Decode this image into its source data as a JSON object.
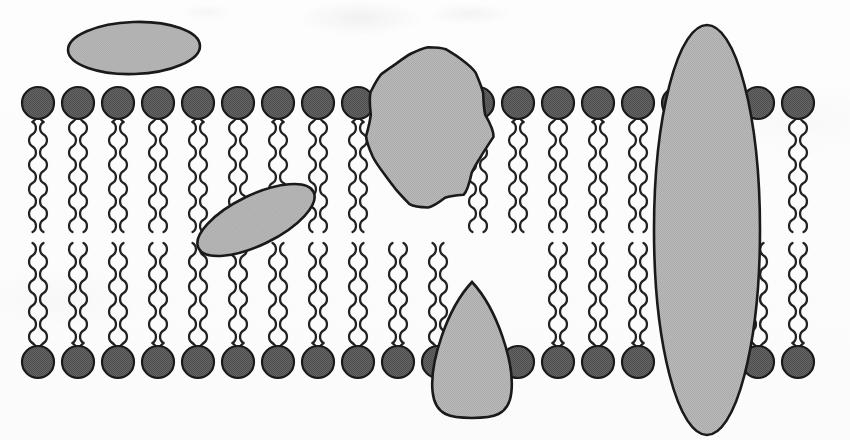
{
  "figure": {
    "name": "phospholipid-bilayer-membrane-diagram",
    "type": "biological-schematic",
    "width": 850,
    "height": 440,
    "background_color": "#fcfcfc",
    "title": "",
    "caption": "",
    "labels": []
  },
  "palette": {
    "paper": "#fcfcfc",
    "outline": "#1a1a1a",
    "lipid_head_fill": "#5e5e5e",
    "lipid_head_fill_dark": "#4f4f4f",
    "lipid_tail_stroke": "#222222",
    "protein_fill": "#b5b5b5",
    "protein_fill_light": "#bdbdbd",
    "protein_outline": "#1a1a1a"
  },
  "membrane": {
    "name": "phospholipid-bilayer",
    "leaflets": 2,
    "upper_leaflet": {
      "name": "upper-leaflet",
      "head_center_y": 103,
      "head_radius_x": 16,
      "head_radius_y": 16,
      "tail_top_y": 118,
      "tail_bottom_y": 232,
      "tails_per_lipid": 2,
      "tail_wave_cycles": 9,
      "lipid_count": 20
    },
    "lower_leaflet": {
      "name": "lower-leaflet",
      "head_center_y": 362,
      "head_radius_x": 16,
      "head_radius_y": 16,
      "tail_top_y": 243,
      "tail_bottom_y": 347,
      "tails_per_lipid": 2,
      "tail_wave_cycles": 8,
      "lipid_count": 20
    },
    "lipid_x_start": 38,
    "lipid_x_spacing": 40.2,
    "hydrophobic_core_gap_y": [
      232,
      243
    ],
    "upper_head_centers_x": [
      38,
      78,
      118,
      158,
      198,
      238,
      278,
      318,
      358,
      398,
      438,
      478,
      518,
      558,
      598,
      638,
      678,
      718,
      758,
      798
    ],
    "lower_head_centers_x": [
      38,
      78,
      118,
      158,
      198,
      238,
      278,
      318,
      358,
      398,
      438,
      478,
      518,
      558,
      598,
      638,
      678,
      718,
      758,
      798
    ],
    "upper_heads_hidden_indices": [
      9,
      10,
      17
    ],
    "lower_heads_hidden_indices": [
      11,
      16
    ],
    "upper_tails_hidden_indices": [
      9,
      10,
      17,
      18
    ],
    "lower_tails_hidden_indices": [
      11,
      12,
      16,
      17
    ]
  },
  "proteins": [
    {
      "name": "peripheral-protein-top-left",
      "shape": "ellipse",
      "position": "extracellular-surface-attached",
      "cx": 134,
      "cy": 48,
      "rx": 66,
      "ry": 26,
      "rotation_deg": -2,
      "fill": "#b8b8b8"
    },
    {
      "name": "integral-protein-large-blob",
      "shape": "irregular-blob",
      "position": "transmembrane-upper-partial",
      "cx": 428,
      "cy": 125,
      "rx": 62,
      "ry": 78,
      "rotation_deg": 0,
      "fill": "#b5b5b5"
    },
    {
      "name": "embedded-protein-tilted-ellipse",
      "shape": "ellipse",
      "position": "upper-leaflet-interior",
      "cx": 256,
      "cy": 220,
      "rx": 64,
      "ry": 25,
      "rotation_deg": -26,
      "fill": "#b8b8b8"
    },
    {
      "name": "integral-protein-teardrop",
      "shape": "teardrop",
      "position": "transmembrane-lower-partial",
      "cx": 472,
      "cy": 350,
      "rx": 41,
      "ry": 68,
      "rotation_deg": 0,
      "fill": "#b5b5b5"
    },
    {
      "name": "transmembrane-protein-channel",
      "shape": "ellipse",
      "position": "spans-full-bilayer",
      "cx": 707,
      "cy": 230,
      "rx": 53,
      "ry": 205,
      "rotation_deg": 0,
      "fill": "#b5b5b5"
    }
  ]
}
